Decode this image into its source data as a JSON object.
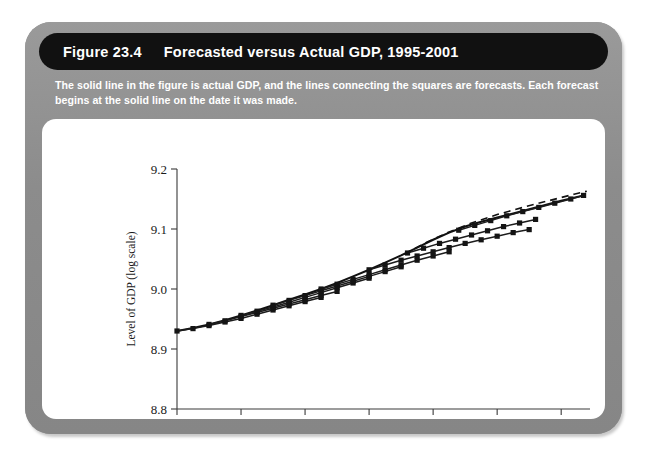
{
  "figure": {
    "number": "Figure 23.4",
    "title": "Forecasted versus Actual GDP, 1995-2001",
    "caption": "The solid line in the figure is actual GDP, and the lines connecting the squares are forecasts. Each forecast begins at the solid line on the date it was made."
  },
  "colors": {
    "panel": "#8e8e8e",
    "titlebar": "#111111",
    "title_text": "#ffffff",
    "chart_background": "#ffffff",
    "line": "#141414"
  },
  "chart_data": {
    "type": "line",
    "title": "Forecasted versus Actual GDP, 1995-2001",
    "xlabel": "",
    "ylabel": "Level of GDP (log scale)",
    "xlim": [
      1995,
      2001.45
    ],
    "ylim": [
      8.8,
      9.2
    ],
    "xticks": [
      1995,
      1996,
      1997,
      1998,
      1999,
      2000,
      2001
    ],
    "xtick_labels": [
      "1995",
      "1996",
      "1997",
      "1998",
      "1999",
      "2000",
      "2001"
    ],
    "yticks": [
      8.8,
      8.9,
      9.0,
      9.1,
      9.2
    ],
    "ytick_labels": [
      "8.8",
      "8.9",
      "9.0",
      "9.1",
      "9.2"
    ],
    "grid": false,
    "legend": "none",
    "series": [
      {
        "name": "Actual GDP",
        "style": "solid",
        "markers": false,
        "x": [
          1995.0,
          1995.25,
          1995.5,
          1995.75,
          1996.0,
          1996.25,
          1996.5,
          1996.75,
          1997.0,
          1997.25,
          1997.5,
          1997.75,
          1998.0,
          1998.25,
          1998.5,
          1998.75,
          1999.0,
          1999.25,
          1999.5,
          1999.75,
          2000.0,
          2000.25,
          2000.5,
          2000.75,
          2001.0,
          2001.35
        ],
        "y": [
          8.93,
          8.935,
          8.941,
          8.948,
          8.956,
          8.964,
          8.973,
          8.982,
          8.991,
          9.0,
          9.01,
          9.021,
          9.032,
          9.044,
          9.056,
          9.069,
          9.082,
          9.094,
          9.104,
          9.112,
          9.119,
          9.126,
          9.133,
          9.14,
          9.147,
          9.156
        ]
      },
      {
        "name": "Forecast made 1995.0",
        "style": "solid",
        "markers": true,
        "x": [
          1995.0,
          1995.25,
          1995.5,
          1995.75,
          1996.0,
          1996.25,
          1996.5,
          1996.75,
          1997.0,
          1997.25
        ],
        "y": [
          8.93,
          8.934,
          8.939,
          8.945,
          8.951,
          8.958,
          8.965,
          8.972,
          8.979,
          8.986
        ]
      },
      {
        "name": "Forecast made 1995.5",
        "style": "solid",
        "markers": true,
        "x": [
          1995.5,
          1995.75,
          1996.0,
          1996.25,
          1996.5,
          1996.75,
          1997.0,
          1997.25,
          1997.5
        ],
        "y": [
          8.941,
          8.947,
          8.954,
          8.961,
          8.968,
          8.975,
          8.982,
          8.989,
          8.996
        ]
      },
      {
        "name": "Forecast made 1996.0",
        "style": "solid",
        "markers": true,
        "x": [
          1996.0,
          1996.25,
          1996.5,
          1996.75,
          1997.0,
          1997.25,
          1997.5,
          1997.75,
          1998.0
        ],
        "y": [
          8.956,
          8.963,
          8.97,
          8.978,
          8.986,
          8.994,
          9.002,
          9.01,
          9.018
        ]
      },
      {
        "name": "Forecast made 1996.5",
        "style": "solid",
        "markers": true,
        "x": [
          1996.5,
          1996.75,
          1997.0,
          1997.25,
          1997.5,
          1997.75,
          1998.0,
          1998.25,
          1998.5
        ],
        "y": [
          8.973,
          8.981,
          8.989,
          8.997,
          9.005,
          9.013,
          9.021,
          9.029,
          9.037
        ]
      },
      {
        "name": "Forecast made 1997.25",
        "style": "solid",
        "markers": true,
        "x": [
          1997.25,
          1997.5,
          1997.75,
          1998.0,
          1998.25,
          1998.5,
          1998.75,
          1999.0,
          1999.25
        ],
        "y": [
          9.0,
          9.008,
          9.016,
          9.024,
          9.032,
          9.04,
          9.048,
          9.055,
          9.062
        ]
      },
      {
        "name": "Forecast made 1998.0",
        "style": "solid",
        "markers": true,
        "x": [
          1998.0,
          1998.25,
          1998.5,
          1998.75,
          1999.0,
          1999.25,
          1999.5,
          1999.75,
          2000.0,
          2000.25,
          2000.5
        ],
        "y": [
          9.032,
          9.04,
          9.048,
          9.055,
          9.062,
          9.069,
          9.076,
          9.082,
          9.088,
          9.094,
          9.099
        ]
      },
      {
        "name": "Forecast made 1998.6",
        "style": "solid",
        "markers": true,
        "x": [
          1998.6,
          1998.85,
          1999.1,
          1999.35,
          1999.6,
          1999.85,
          2000.1,
          2000.35,
          2000.6
        ],
        "y": [
          9.06,
          9.068,
          9.076,
          9.083,
          9.09,
          9.097,
          9.104,
          9.11,
          9.116
        ]
      },
      {
        "name": "Forecast made 1999.4",
        "style": "solid",
        "markers": true,
        "x": [
          1999.4,
          1999.65,
          1999.9,
          2000.15,
          2000.4,
          2000.65,
          2000.9,
          2001.15,
          2001.35
        ],
        "y": [
          9.098,
          9.106,
          9.114,
          9.122,
          9.129,
          9.136,
          9.143,
          9.15,
          9.156
        ]
      },
      {
        "name": "Forecast made 1999.0 (dashed)",
        "style": "dashed",
        "markers": false,
        "x": [
          1998.55,
          1998.9,
          1999.25,
          1999.6,
          2000.0,
          2000.4,
          2000.8,
          2001.2,
          2001.4
        ],
        "y": [
          9.058,
          9.078,
          9.095,
          9.11,
          9.124,
          9.136,
          9.147,
          9.158,
          9.163
        ]
      }
    ]
  }
}
